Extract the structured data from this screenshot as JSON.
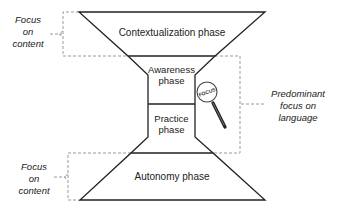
{
  "phases": {
    "contextualization": "Contextualization phase",
    "awareness_line1": "Awareness",
    "awareness_line2": "phase",
    "practice_line1": "Practice",
    "practice_line2": "phase",
    "autonomy": "Autonomy phase"
  },
  "annotations": {
    "top_left": [
      "Focus",
      "on",
      "content"
    ],
    "bottom_left": [
      "Focus",
      "on",
      "content"
    ],
    "right": [
      "Predominant",
      "focus on",
      "language"
    ]
  },
  "magnifier": {
    "label": "FOCUS",
    "icon": "magnifying-glass-icon"
  },
  "colors": {
    "stroke": "#222222",
    "dashed": "#9a9a9a",
    "background": "#ffffff"
  }
}
